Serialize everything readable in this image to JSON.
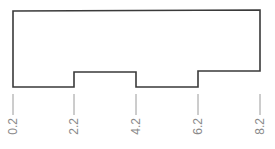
{
  "diagram": {
    "type": "stepped-profile",
    "outline_color": "#3a3a3a",
    "tick_color": "#9a9a9a",
    "label_color": "#8a8a8a",
    "profile_points": [
      [
        13,
        11
      ],
      [
        260,
        10
      ],
      [
        260,
        71
      ],
      [
        198,
        71
      ],
      [
        198,
        87
      ],
      [
        136,
        87
      ],
      [
        136,
        72
      ],
      [
        74,
        72
      ],
      [
        74,
        87
      ],
      [
        13,
        87
      ]
    ],
    "ticks": [
      {
        "x": 13,
        "label": "0.2"
      },
      {
        "x": 74,
        "label": "2.2"
      },
      {
        "x": 136,
        "label": "4.2"
      },
      {
        "x": 198,
        "label": "6.2"
      },
      {
        "x": 260,
        "label": "8.2"
      }
    ]
  }
}
